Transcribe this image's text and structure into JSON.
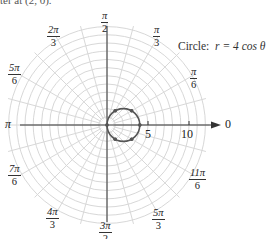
{
  "header_fragment": "ter at (2, 0).",
  "caption": {
    "prefix": "Circle:",
    "equation": "r = 4 cos θ"
  },
  "colors": {
    "grid": "#d8d8d8",
    "axis": "#333333",
    "curve": "#555555",
    "points": "#555555"
  },
  "angle_labels": [
    {
      "id": "0",
      "num": "0",
      "den": null
    },
    {
      "id": "pi_6",
      "num": "π",
      "den": "6"
    },
    {
      "id": "pi_3",
      "num": "π",
      "den": "3"
    },
    {
      "id": "pi_2",
      "num": "π",
      "den": "2"
    },
    {
      "id": "2pi_3",
      "num": "2π",
      "den": "3"
    },
    {
      "id": "5pi_6",
      "num": "5π",
      "den": "6"
    },
    {
      "id": "pi",
      "num": "π",
      "den": null
    },
    {
      "id": "7pi_6",
      "num": "7π",
      "den": "6"
    },
    {
      "id": "4pi_3",
      "num": "4π",
      "den": "3"
    },
    {
      "id": "3pi_2",
      "num": "3π",
      "den": "2"
    },
    {
      "id": "5pi_3",
      "num": "5π",
      "den": "3"
    },
    {
      "id": "11pi_6",
      "num": "11π",
      "den": "6"
    }
  ],
  "radial_ticks": [
    {
      "value": "5"
    },
    {
      "value": "10"
    }
  ],
  "chart_data": {
    "type": "polar",
    "curve": {
      "equation": "r = 4 cos θ",
      "center": [
        2,
        0
      ],
      "radius": 2
    },
    "points_theta_deg": [
      0,
      30,
      60,
      90,
      120,
      150,
      180,
      210,
      240,
      270,
      300,
      330
    ],
    "grid": {
      "radial_rings": 12,
      "angular_step_deg": 15
    },
    "radial_ticks": [
      5,
      10
    ],
    "angle_labels": [
      "0",
      "π/6",
      "π/3",
      "π/2",
      "2π/3",
      "5π/6",
      "π",
      "7π/6",
      "4π/3",
      "3π/2",
      "5π/3",
      "11π/6"
    ]
  }
}
